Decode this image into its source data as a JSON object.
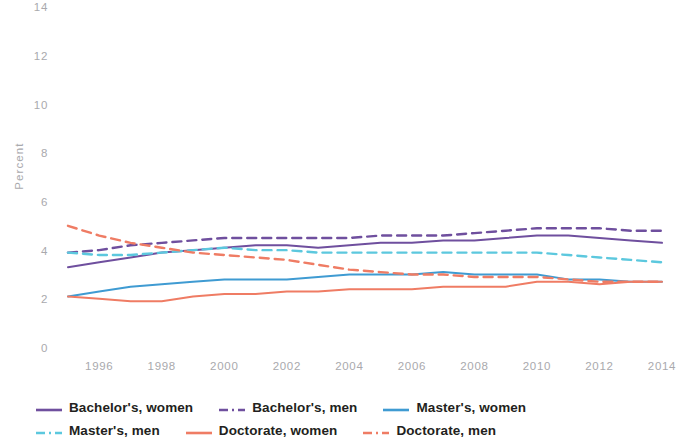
{
  "chart_data": {
    "type": "line",
    "title": "",
    "xlabel": "",
    "ylabel": "Percent",
    "xlim": [
      1995,
      2014
    ],
    "ylim": [
      0,
      14
    ],
    "ytick_step": 2,
    "xtick_step": 2,
    "grid": false,
    "legend_position": "bottom",
    "x": [
      1995,
      1996,
      1997,
      1998,
      1999,
      2000,
      2001,
      2002,
      2003,
      2004,
      2005,
      2006,
      2007,
      2008,
      2009,
      2010,
      2011,
      2012,
      2013,
      2014
    ],
    "yticks": [
      "0",
      "2",
      "4",
      "6",
      "8",
      "10",
      "12",
      "14"
    ],
    "xticks": [
      "1996",
      "1998",
      "2000",
      "2002",
      "2004",
      "2006",
      "2008",
      "2010",
      "2012",
      "2014"
    ],
    "series": [
      {
        "name": "Bachelor's, women",
        "color": "#6f4f9e",
        "style": "solid",
        "values": [
          3.4,
          3.6,
          3.8,
          4.0,
          4.1,
          4.2,
          4.3,
          4.3,
          4.2,
          4.3,
          4.4,
          4.4,
          4.5,
          4.5,
          4.6,
          4.7,
          4.7,
          4.6,
          4.5,
          4.4
        ]
      },
      {
        "name": "Bachelor's, men",
        "color": "#6f4f9e",
        "style": "dashed",
        "values": [
          4.0,
          4.1,
          4.3,
          4.4,
          4.5,
          4.6,
          4.6,
          4.6,
          4.6,
          4.6,
          4.7,
          4.7,
          4.7,
          4.8,
          4.9,
          5.0,
          5.0,
          5.0,
          4.9,
          4.9
        ]
      },
      {
        "name": "Master's, women",
        "color": "#3f9bd2",
        "style": "solid",
        "values": [
          2.2,
          2.4,
          2.6,
          2.7,
          2.8,
          2.9,
          2.9,
          2.9,
          3.0,
          3.1,
          3.1,
          3.1,
          3.2,
          3.1,
          3.1,
          3.1,
          2.9,
          2.9,
          2.8,
          2.8
        ]
      },
      {
        "name": "Master's, men",
        "color": "#5cc8de",
        "style": "dashed",
        "values": [
          4.0,
          3.9,
          3.9,
          4.0,
          4.1,
          4.2,
          4.1,
          4.1,
          4.0,
          4.0,
          4.0,
          4.0,
          4.0,
          4.0,
          4.0,
          4.0,
          3.9,
          3.8,
          3.7,
          3.6
        ]
      },
      {
        "name": "Doctorate, women",
        "color": "#ef7c64",
        "style": "solid",
        "values": [
          2.2,
          2.1,
          2.0,
          2.0,
          2.2,
          2.3,
          2.3,
          2.4,
          2.4,
          2.5,
          2.5,
          2.5,
          2.6,
          2.6,
          2.6,
          2.8,
          2.8,
          2.7,
          2.8,
          2.8
        ]
      },
      {
        "name": "Doctorate, men",
        "color": "#ef7c64",
        "style": "dashed",
        "values": [
          5.1,
          4.7,
          4.4,
          4.2,
          4.0,
          3.9,
          3.8,
          3.7,
          3.5,
          3.3,
          3.2,
          3.1,
          3.1,
          3.0,
          3.0,
          3.0,
          2.9,
          2.8,
          2.8,
          2.8
        ]
      }
    ]
  },
  "axis": {
    "y_title": "Percent"
  },
  "legend": {
    "rows": [
      [
        {
          "label": "Bachelor's, women",
          "color": "#6f4f9e",
          "style": "solid"
        },
        {
          "label": "Bachelor's, men",
          "color": "#6f4f9e",
          "style": "dashed"
        },
        {
          "label": "Master's, women",
          "color": "#3f9bd2",
          "style": "solid"
        }
      ],
      [
        {
          "label": "Master's, men",
          "color": "#5cc8de",
          "style": "dashed"
        },
        {
          "label": "Doctorate, women",
          "color": "#ef7c64",
          "style": "solid"
        },
        {
          "label": "Doctorate, men",
          "color": "#ef7c64",
          "style": "dashed"
        }
      ]
    ]
  }
}
